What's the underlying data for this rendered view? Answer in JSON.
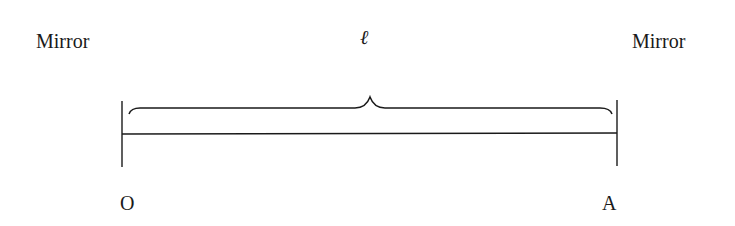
{
  "diagram": {
    "left_label": "Mirror",
    "right_label": "Mirror",
    "length_symbol": "ℓ",
    "left_point": "O",
    "right_point": "A",
    "colors": {
      "ink": "#1a1a1a",
      "background": "#ffffff"
    }
  }
}
